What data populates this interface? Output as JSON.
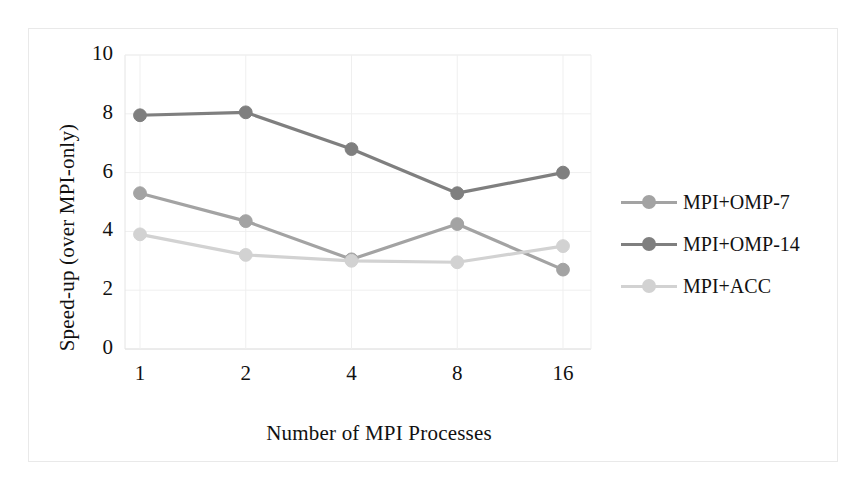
{
  "chart_data": {
    "type": "line",
    "title": "",
    "xlabel": "Number of MPI Processes",
    "ylabel": "Speed-up (over MPI-only)",
    "categories": [
      "1",
      "2",
      "4",
      "8",
      "16"
    ],
    "xticklabels": [
      "1",
      "2",
      "4",
      "8",
      "16"
    ],
    "yticklabels": [
      "0",
      "2",
      "4",
      "6",
      "8",
      "10"
    ],
    "ylim": [
      0,
      10
    ],
    "ytick_step": 2,
    "grid": true,
    "legend_position": "right",
    "series": [
      {
        "name": "MPI+OMP-7",
        "color": "#a3a3a3",
        "values": [
          5.3,
          4.35,
          3.05,
          4.25,
          2.7
        ]
      },
      {
        "name": "MPI+OMP-14",
        "color": "#7f7f7f",
        "values": [
          7.95,
          8.05,
          6.8,
          5.3,
          6.0
        ]
      },
      {
        "name": "MPI+ACC",
        "color": "#d2d2d2",
        "values": [
          3.9,
          3.2,
          3.0,
          2.95,
          3.5
        ]
      }
    ]
  },
  "legend": {
    "items": [
      {
        "label": "MPI+OMP-7"
      },
      {
        "label": "MPI+OMP-14"
      },
      {
        "label": "MPI+ACC"
      }
    ]
  },
  "axes": {
    "y_title": "Speed-up (over MPI-only)",
    "x_title": "Number of MPI Processes"
  }
}
